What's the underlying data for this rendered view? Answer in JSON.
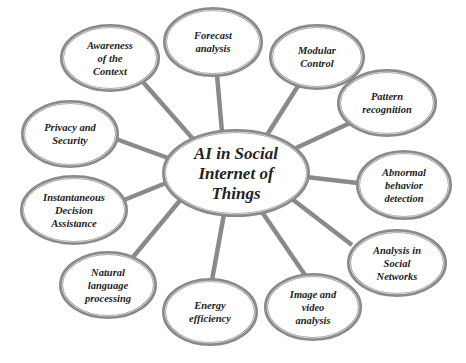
{
  "diagram": {
    "type": "mind-map",
    "colors": {
      "background": "#ffffff",
      "edge": "#8a8a8a",
      "ellipse_outer": "#8a8a8a",
      "ellipse_inner": "#d4d4d4",
      "ellipse_fill": "#ffffff",
      "text": "#222222"
    },
    "center": {
      "id": "center",
      "label_lines": [
        "AI in Social",
        "Internet of",
        "Things"
      ],
      "cx": 236,
      "cy": 173,
      "rx": 72,
      "ry": 42
    },
    "nodes": [
      {
        "id": "awareness",
        "label_lines": [
          "Awareness",
          "of the",
          "Context"
        ],
        "cx": 110,
        "cy": 58,
        "rx": 48,
        "ry": 32
      },
      {
        "id": "forecast",
        "label_lines": [
          "Forecast",
          "analysis"
        ],
        "cx": 213,
        "cy": 42,
        "rx": 48,
        "ry": 33
      },
      {
        "id": "modular",
        "label_lines": [
          "Modular",
          "Control"
        ],
        "cx": 317,
        "cy": 57,
        "rx": 46,
        "ry": 31
      },
      {
        "id": "pattern",
        "label_lines": [
          "Pattern",
          "recognition"
        ],
        "cx": 387,
        "cy": 103,
        "rx": 48,
        "ry": 32
      },
      {
        "id": "privacy",
        "label_lines": [
          "Privacy and",
          "Security"
        ],
        "cx": 70,
        "cy": 134,
        "rx": 47,
        "ry": 32
      },
      {
        "id": "abnormal",
        "label_lines": [
          "Abnormal",
          "behavior",
          "detection"
        ],
        "cx": 404,
        "cy": 185,
        "rx": 46,
        "ry": 33
      },
      {
        "id": "instantaneous",
        "label_lines": [
          "Instantaneous",
          "Decision",
          "Assistance"
        ],
        "cx": 74,
        "cy": 210,
        "rx": 52,
        "ry": 33
      },
      {
        "id": "social-networks",
        "label_lines": [
          "Analysis in",
          "Social",
          "Networks"
        ],
        "cx": 397,
        "cy": 263,
        "rx": 48,
        "ry": 32
      },
      {
        "id": "nlp",
        "label_lines": [
          "Natural",
          "language",
          "processing"
        ],
        "cx": 108,
        "cy": 285,
        "rx": 47,
        "ry": 32
      },
      {
        "id": "energy",
        "label_lines": [
          "Energy",
          "efficiency"
        ],
        "cx": 210,
        "cy": 312,
        "rx": 46,
        "ry": 32
      },
      {
        "id": "image-video",
        "label_lines": [
          "Image and",
          "video",
          "analysis"
        ],
        "cx": 313,
        "cy": 307,
        "rx": 47,
        "ry": 32
      }
    ],
    "edges": [
      {
        "from": "center",
        "to": "awareness",
        "x1": 193,
        "y1": 139,
        "x2": 143,
        "y2": 82
      },
      {
        "from": "center",
        "to": "forecast",
        "x1": 222,
        "y1": 132,
        "x2": 217,
        "y2": 75
      },
      {
        "from": "center",
        "to": "modular",
        "x1": 267,
        "y1": 135,
        "x2": 298,
        "y2": 86
      },
      {
        "from": "center",
        "to": "pattern",
        "x1": 296,
        "y1": 148,
        "x2": 350,
        "y2": 123
      },
      {
        "from": "center",
        "to": "privacy",
        "x1": 168,
        "y1": 158,
        "x2": 116,
        "y2": 139
      },
      {
        "from": "center",
        "to": "abnormal",
        "x1": 306,
        "y1": 177,
        "x2": 358,
        "y2": 183
      },
      {
        "from": "center",
        "to": "instantaneous",
        "x1": 166,
        "y1": 183,
        "x2": 124,
        "y2": 200
      },
      {
        "from": "center",
        "to": "social-networks",
        "x1": 292,
        "y1": 199,
        "x2": 352,
        "y2": 245
      },
      {
        "from": "center",
        "to": "nlp",
        "x1": 182,
        "y1": 198,
        "x2": 133,
        "y2": 257
      },
      {
        "from": "center",
        "to": "energy",
        "x1": 224,
        "y1": 214,
        "x2": 212,
        "y2": 280
      },
      {
        "from": "center",
        "to": "image-video",
        "x1": 262,
        "y1": 212,
        "x2": 305,
        "y2": 275
      }
    ]
  }
}
